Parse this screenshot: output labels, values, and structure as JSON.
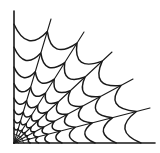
{
  "image": {
    "subject": "spider web corner",
    "width": 160,
    "height": 153,
    "background": "#ffffff",
    "stroke_color": "#1a1a1a"
  },
  "web": {
    "origin": [
      14,
      143
    ],
    "spoke_tips": [
      [
        14,
        11
      ],
      [
        51,
        19
      ],
      [
        84,
        32
      ],
      [
        112,
        52
      ],
      [
        133,
        79
      ],
      [
        150,
        108
      ],
      [
        155,
        143
      ]
    ],
    "ring_fractions": [
      0.03,
      0.07,
      0.115,
      0.175,
      0.25,
      0.34,
      0.45,
      0.575,
      0.725,
      0.9
    ],
    "sag": 0.22
  }
}
